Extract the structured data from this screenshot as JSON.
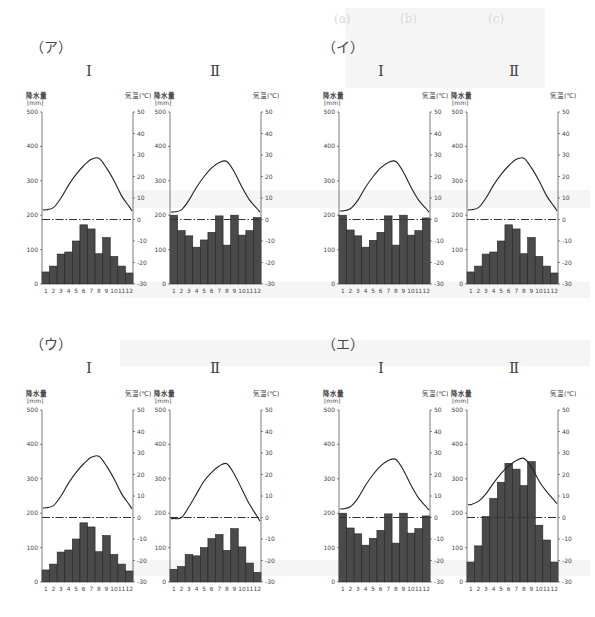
{
  "faint_header": {
    "row1": [
      "(a)",
      "(b)",
      "(c)"
    ]
  },
  "axis": {
    "left_label_line1": "降水量",
    "left_label_line2": "[mm]",
    "right_label": "気温(℃)",
    "left_ticks": [
      0,
      100,
      200,
      300,
      400,
      500
    ],
    "right_ticks": [
      -30,
      -20,
      -10,
      0,
      10,
      20,
      30,
      40,
      50
    ],
    "months": [
      "1",
      "2",
      "3",
      "4",
      "5",
      "6",
      "7",
      "8",
      "9",
      "10",
      "11",
      "12"
    ]
  },
  "groups": [
    {
      "label": "（ア）",
      "sub": [
        "Ⅰ",
        "Ⅱ"
      ]
    },
    {
      "label": "（イ）",
      "sub": [
        "Ⅰ",
        "Ⅱ"
      ]
    },
    {
      "label": "（ウ）",
      "sub": [
        "Ⅰ",
        "Ⅱ"
      ]
    },
    {
      "label": "（エ）",
      "sub": [
        "Ⅰ",
        "Ⅱ"
      ]
    }
  ],
  "chart_data": [
    {
      "id": "A-I",
      "group": "（ア）",
      "title": "Ⅰ",
      "type": "bar+line",
      "categories": [
        "1",
        "2",
        "3",
        "4",
        "5",
        "6",
        "7",
        "8",
        "9",
        "10",
        "11",
        "12"
      ],
      "series": [
        {
          "name": "降水量 [mm]",
          "type": "bar",
          "axis": "left",
          "values": [
            35,
            52,
            87,
            93,
            125,
            172,
            160,
            88,
            135,
            80,
            52,
            32
          ]
        },
        {
          "name": "気温 (℃)",
          "type": "line",
          "axis": "right",
          "values": [
            4.5,
            5.5,
            10,
            16,
            21,
            25,
            28,
            28.5,
            24,
            18,
            11,
            6
          ]
        }
      ],
      "xlabel": "",
      "ylabel_left": "降水量 [mm]",
      "ylabel_right": "気温(℃)",
      "ylim_left": [
        0,
        500
      ],
      "ylim_right": [
        -30,
        50
      ],
      "zero_line": "dash-dot at 0℃"
    },
    {
      "id": "A-II",
      "group": "（ア）",
      "title": "Ⅱ",
      "type": "bar+line",
      "categories": [
        "1",
        "2",
        "3",
        "4",
        "5",
        "6",
        "7",
        "8",
        "9",
        "10",
        "11",
        "12"
      ],
      "series": [
        {
          "name": "降水量 [mm]",
          "type": "bar",
          "axis": "left",
          "values": [
            200,
            155,
            140,
            107,
            128,
            150,
            198,
            113,
            200,
            142,
            155,
            193
          ]
        },
        {
          "name": "気温 (℃)",
          "type": "line",
          "axis": "right",
          "values": [
            3.5,
            4.5,
            9,
            15,
            20,
            24,
            26.5,
            27,
            22,
            15,
            9,
            5
          ]
        }
      ],
      "ylim_left": [
        0,
        500
      ],
      "ylim_right": [
        -30,
        50
      ]
    },
    {
      "id": "I-I",
      "group": "（イ）",
      "title": "Ⅰ",
      "type": "bar+line",
      "categories": [
        "1",
        "2",
        "3",
        "4",
        "5",
        "6",
        "7",
        "8",
        "9",
        "10",
        "11",
        "12"
      ],
      "series": [
        {
          "name": "降水量 [mm]",
          "type": "bar",
          "axis": "left",
          "values": [
            200,
            157,
            140,
            107,
            127,
            150,
            198,
            113,
            200,
            142,
            155,
            192
          ]
        },
        {
          "name": "気温 (℃)",
          "type": "line",
          "axis": "right",
          "values": [
            4,
            5,
            9,
            15,
            20,
            24,
            26.5,
            27,
            22,
            15,
            9,
            5
          ]
        }
      ],
      "ylim_left": [
        0,
        500
      ],
      "ylim_right": [
        -30,
        50
      ]
    },
    {
      "id": "I-II",
      "group": "（イ）",
      "title": "Ⅱ",
      "type": "bar+line",
      "categories": [
        "1",
        "2",
        "3",
        "4",
        "5",
        "6",
        "7",
        "8",
        "9",
        "10",
        "11",
        "12"
      ],
      "series": [
        {
          "name": "降水量 [mm]",
          "type": "bar",
          "axis": "left",
          "values": [
            35,
            52,
            87,
            93,
            125,
            172,
            160,
            88,
            135,
            80,
            52,
            32
          ]
        },
        {
          "name": "気温 (℃)",
          "type": "line",
          "axis": "right",
          "values": [
            4.5,
            5.5,
            10,
            16,
            21,
            25,
            28,
            28.5,
            24,
            18,
            11,
            6
          ]
        }
      ],
      "ylim_left": [
        0,
        500
      ],
      "ylim_right": [
        -30,
        50
      ]
    },
    {
      "id": "U-I",
      "group": "（ウ）",
      "title": "Ⅰ",
      "type": "bar+line",
      "categories": [
        "1",
        "2",
        "3",
        "4",
        "5",
        "6",
        "7",
        "8",
        "9",
        "10",
        "11",
        "12"
      ],
      "series": [
        {
          "name": "降水量 [mm]",
          "type": "bar",
          "axis": "left",
          "values": [
            35,
            52,
            87,
            93,
            125,
            172,
            160,
            88,
            135,
            80,
            52,
            32
          ]
        },
        {
          "name": "気温 (℃)",
          "type": "line",
          "axis": "right",
          "values": [
            4.5,
            5.5,
            10,
            16,
            21,
            25,
            28,
            28.5,
            24,
            18,
            11,
            6
          ]
        }
      ],
      "ylim_left": [
        0,
        500
      ],
      "ylim_right": [
        -30,
        50
      ]
    },
    {
      "id": "U-II",
      "group": "（ウ）",
      "title": "Ⅱ",
      "type": "bar+line",
      "categories": [
        "1",
        "2",
        "3",
        "4",
        "5",
        "6",
        "7",
        "8",
        "9",
        "10",
        "11",
        "12"
      ],
      "series": [
        {
          "name": "降水量 [mm]",
          "type": "bar",
          "axis": "left",
          "values": [
            37,
            45,
            80,
            76,
            100,
            126,
            138,
            92,
            155,
            102,
            55,
            28
          ]
        },
        {
          "name": "気温 (℃)",
          "type": "line",
          "axis": "right",
          "values": [
            -0.5,
            0,
            5,
            11,
            17,
            21,
            24,
            25,
            20,
            13,
            6,
            0.5
          ]
        }
      ],
      "ylim_left": [
        0,
        500
      ],
      "ylim_right": [
        -30,
        50
      ]
    },
    {
      "id": "E-I",
      "group": "（エ）",
      "title": "Ⅰ",
      "type": "bar+line",
      "categories": [
        "1",
        "2",
        "3",
        "4",
        "5",
        "6",
        "7",
        "8",
        "9",
        "10",
        "11",
        "12"
      ],
      "series": [
        {
          "name": "降水量 [mm]",
          "type": "bar",
          "axis": "left",
          "values": [
            200,
            157,
            140,
            107,
            127,
            150,
            198,
            113,
            200,
            142,
            155,
            192
          ]
        },
        {
          "name": "気温 (℃)",
          "type": "line",
          "axis": "right",
          "values": [
            4,
            5,
            9,
            15,
            20,
            24,
            26.5,
            27,
            22,
            15,
            9,
            5
          ]
        }
      ],
      "ylim_left": [
        0,
        500
      ],
      "ylim_right": [
        -30,
        50
      ]
    },
    {
      "id": "E-II",
      "group": "（エ）",
      "title": "Ⅱ",
      "type": "bar+line",
      "categories": [
        "1",
        "2",
        "3",
        "4",
        "5",
        "6",
        "7",
        "8",
        "9",
        "10",
        "11",
        "12"
      ],
      "series": [
        {
          "name": "降水量 [mm]",
          "type": "bar",
          "axis": "left",
          "values": [
            58,
            105,
            190,
            243,
            290,
            345,
            328,
            280,
            350,
            165,
            122,
            58
          ]
        },
        {
          "name": "気温 (℃)",
          "type": "line",
          "axis": "right",
          "values": [
            6,
            7.5,
            11,
            16,
            20.5,
            24,
            26.5,
            27.5,
            23.5,
            17,
            12,
            8
          ]
        }
      ],
      "ylim_left": [
        0,
        500
      ],
      "ylim_right": [
        -30,
        50
      ]
    }
  ]
}
